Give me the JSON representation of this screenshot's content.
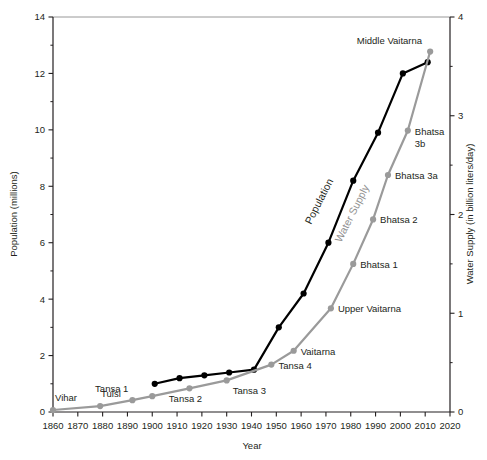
{
  "chart_data": {
    "type": "line",
    "title": "",
    "xlabel": "Year",
    "ylabel": "Population (millions)",
    "y2label": "Water Supply (in billion liters/day)",
    "xlim": [
      1860,
      2020
    ],
    "ylim": [
      0,
      14
    ],
    "y2lim": [
      0,
      4
    ],
    "grid": false,
    "legend": "inline-annotations",
    "xticks": [
      1860,
      1870,
      1880,
      1890,
      1900,
      1910,
      1920,
      1930,
      1940,
      1950,
      1960,
      1970,
      1980,
      1990,
      2000,
      2010,
      2020
    ],
    "yticks": [
      0,
      2,
      4,
      6,
      8,
      10,
      12,
      14
    ],
    "y2ticks": [
      0,
      1,
      2,
      3,
      4
    ],
    "y2minorticks": [
      0.5,
      1.5,
      2.5,
      3.5
    ],
    "series": [
      {
        "name": "Population",
        "color": "#000000",
        "axis": "left",
        "units": "millions",
        "x": [
          1901,
          1911,
          1921,
          1931,
          1941,
          1951,
          1961,
          1971,
          1981,
          1991,
          2001,
          2011
        ],
        "values": [
          1.0,
          1.2,
          1.3,
          1.4,
          1.5,
          3.0,
          4.2,
          6.0,
          8.2,
          9.9,
          12.0,
          12.4
        ]
      },
      {
        "name": "Water Supply",
        "color": "#9a9a9a",
        "axis": "right",
        "units": "billion liters/day",
        "x": [
          1860,
          1879,
          1892,
          1900,
          1915,
          1930,
          1948,
          1957,
          1972,
          1981,
          1989,
          1995,
          2003,
          2012
        ],
        "values": [
          0.02,
          0.06,
          0.12,
          0.16,
          0.24,
          0.32,
          0.48,
          0.62,
          1.05,
          1.5,
          1.95,
          2.4,
          2.85,
          3.65
        ]
      }
    ],
    "annotations": [
      {
        "label": "Vihar",
        "series": "Water Supply",
        "x": 1860,
        "value": 0.02
      },
      {
        "label": "Tulsi",
        "series": "Water Supply",
        "x": 1879,
        "value": 0.06
      },
      {
        "label": "Tansa 1",
        "series": "Water Supply",
        "x": 1892,
        "value": 0.12
      },
      {
        "label": "Tansa 2",
        "series": "Water Supply",
        "x": 1915,
        "value": 0.24
      },
      {
        "label": "Tansa 3",
        "series": "Water Supply",
        "x": 1930,
        "value": 0.32
      },
      {
        "label": "Tansa 4",
        "series": "Water Supply",
        "x": 1948,
        "value": 0.48
      },
      {
        "label": "Vaitarna",
        "series": "Water Supply",
        "x": 1957,
        "value": 0.62
      },
      {
        "label": "Upper Vaitarna",
        "series": "Water Supply",
        "x": 1972,
        "value": 1.05
      },
      {
        "label": "Bhatsa 1",
        "series": "Water Supply",
        "x": 1981,
        "value": 1.5
      },
      {
        "label": "Bhatsa 2",
        "series": "Water Supply",
        "x": 1989,
        "value": 1.95
      },
      {
        "label": "Bhatsa 3a",
        "series": "Water Supply",
        "x": 1995,
        "value": 2.4
      },
      {
        "label": "Bhatsa 3b",
        "series": "Water Supply",
        "x": 2003,
        "value": 2.85
      },
      {
        "label": "Middle Vaitarna",
        "series": "Water Supply",
        "x": 2012,
        "value": 3.65
      }
    ],
    "series_inline_labels": [
      {
        "label": "Population",
        "color": "#000000"
      },
      {
        "label": "Water Supply",
        "color": "#8f8f8f"
      }
    ]
  },
  "axes": {
    "x_title": "Year",
    "y_left_title": "Population (millions)",
    "y_right_title": "Water Supply (in billion liters/day)",
    "x_tick_labels": [
      "1860",
      "1870",
      "1880",
      "1890",
      "1900",
      "1910",
      "1920",
      "1930",
      "1940",
      "1950",
      "1960",
      "1970",
      "1980",
      "1990",
      "2000",
      "2010",
      "2020"
    ],
    "y_left_tick_labels": [
      "0",
      "2",
      "4",
      "6",
      "8",
      "10",
      "12",
      "14"
    ],
    "y_right_tick_labels": [
      "0",
      "1",
      "2",
      "3",
      "4"
    ]
  },
  "annotation_labels": {
    "vihar": "Vihar",
    "tulsi": "Tulsi",
    "tansa1": "Tansa 1",
    "tansa2": "Tansa 2",
    "tansa3": "Tansa 3",
    "tansa4": "Tansa 4",
    "vaitarna": "Vaitarna",
    "upper_vaitarna": "Upper Vaitarna",
    "bhatsa1": "Bhatsa 1",
    "bhatsa2": "Bhatsa 2",
    "bhatsa3a": "Bhatsa 3a",
    "bhatsa3b_line1": "Bhatsa",
    "bhatsa3b_line2": "3b",
    "middle_vaitarna": "Middle Vaitarna",
    "population": "Population",
    "water_supply": "Water Supply"
  },
  "colors": {
    "population": "#000000",
    "water_supply": "#9a9a9a",
    "axis": "#231f20",
    "background": "#ffffff"
  }
}
